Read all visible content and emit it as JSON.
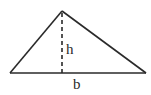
{
  "diagram": {
    "type": "triangle-area",
    "vertices": {
      "apex": [
        62,
        11
      ],
      "left": [
        10,
        73
      ],
      "right": [
        146,
        73
      ]
    },
    "height_line": {
      "from": [
        62,
        12
      ],
      "to": [
        62,
        73
      ],
      "style": "dashed"
    },
    "labels": {
      "height": "h",
      "base": "b"
    },
    "colors": {
      "stroke": "#2a2a2a",
      "background": "#ffffff"
    }
  }
}
